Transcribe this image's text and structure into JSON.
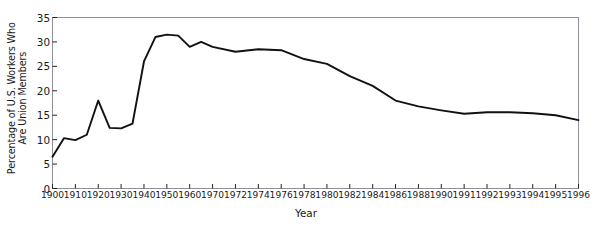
{
  "chart_data": {
    "type": "line",
    "title": "",
    "xlabel": "Year",
    "ylabel": "Percentage of U.S. Workers Who Are Union Members",
    "ylabel_line1": "Percentage of U.S. Workers Who",
    "ylabel_line2": "Are Union Members",
    "ylim": [
      0,
      35
    ],
    "yticks": [
      0,
      5,
      10,
      15,
      20,
      25,
      30,
      35
    ],
    "ytick_labels": [
      "0",
      "5",
      "10",
      "15",
      "20",
      "25",
      "30",
      "35"
    ],
    "grid": false,
    "legend": "none",
    "line_color": "#111111",
    "border_color": "#8f8f97",
    "background": "#ffffff",
    "xtick_labels": [
      "1900",
      "1910",
      "1920",
      "1930",
      "1940",
      "1950",
      "1960",
      "1970",
      "1972",
      "1974",
      "1976",
      "1978",
      "1980",
      "1982",
      "1984",
      "1986",
      "1988",
      "1990",
      "1991",
      "1992",
      "1993",
      "1994",
      "1995",
      "1996"
    ],
    "x": [
      1900,
      1905,
      1910,
      1915,
      1920,
      1925,
      1930,
      1935,
      1940,
      1945,
      1950,
      1955,
      1960,
      1965,
      1970,
      1972,
      1974,
      1976,
      1978,
      1980,
      1982,
      1984,
      1986,
      1988,
      1990,
      1991,
      1992,
      1993,
      1994,
      1995,
      1996
    ],
    "values": [
      6.5,
      10.3,
      9.9,
      11.0,
      18.0,
      12.4,
      12.3,
      13.3,
      26.0,
      31.0,
      31.5,
      31.3,
      29.0,
      30.0,
      29.0,
      28.0,
      28.5,
      28.3,
      26.5,
      25.5,
      23.0,
      21.0,
      18.0,
      16.8,
      16.0,
      15.3,
      15.6,
      15.6,
      15.4,
      15.0,
      14.0
    ]
  }
}
